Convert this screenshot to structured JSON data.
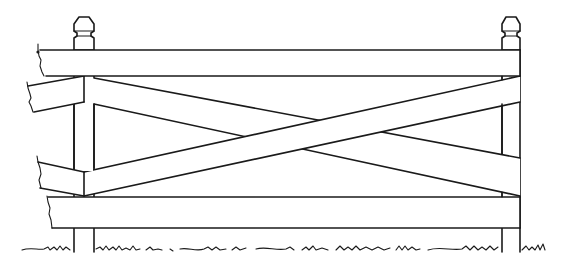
{
  "image": {
    "subject": "fence-line-drawing",
    "description": "Black-and-white line illustration of a wooden fence section with two capped posts, a top rail, a bottom rail, and an X-shaped cross brace between them, standing on grassy ground",
    "colors": {
      "background": "#ffffff",
      "ink": "#1a1a1a"
    },
    "elements": {
      "posts": [
        "left-post",
        "right-post"
      ],
      "rails": [
        "top-rail",
        "bottom-rail"
      ],
      "braces": [
        "descending-brace",
        "ascending-brace"
      ],
      "ground": "grass-line"
    }
  }
}
